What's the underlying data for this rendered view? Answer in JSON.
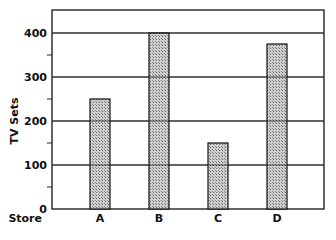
{
  "chart_data": {
    "type": "bar",
    "title": "",
    "xlabel": "Store",
    "ylabel": "TV Sets",
    "categories": [
      "A",
      "B",
      "C",
      "D"
    ],
    "values": [
      250,
      400,
      150,
      375
    ],
    "ylim": [
      0,
      460
    ],
    "yticks_major": [
      0,
      100,
      200,
      300,
      400
    ],
    "yticks_minor": [
      50,
      150,
      250,
      350
    ],
    "grid": true,
    "legend": null,
    "bar_fill": "hatched gray",
    "colors": {
      "bar": "#b8b8b8",
      "border": "#111111",
      "grid": "#222222"
    }
  }
}
